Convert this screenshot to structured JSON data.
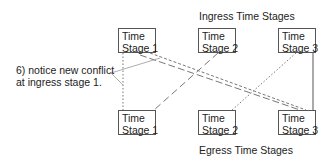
{
  "title_top": "Ingress Time Stages",
  "title_bottom": "Egress Time Stages",
  "annotation": {
    "line1": "6) notice new conflict",
    "line2": "at ingress stage 1."
  },
  "ingress": [
    {
      "line1": "Time",
      "line2": "Stage 1"
    },
    {
      "line1": "Time",
      "line2": "Stage 2"
    },
    {
      "line1": "Time",
      "line2": "Stage 3"
    }
  ],
  "egress": [
    {
      "line1": "Time",
      "line2": "Stage 1"
    },
    {
      "line1": "Time",
      "line2": "Stage 2"
    },
    {
      "line1": "Time",
      "line2": "Stage 3"
    }
  ],
  "connections": [
    {
      "from": "ingress-1",
      "to": "egress-1",
      "style": "dotted"
    },
    {
      "from": "ingress-1",
      "to": "egress-3",
      "style": "short-dash"
    },
    {
      "from": "ingress-1",
      "to": "egress-3",
      "style": "long-dash"
    },
    {
      "from": "ingress-2",
      "to": "egress-1",
      "style": "long-dash"
    },
    {
      "from": "ingress-3",
      "to": "egress-2",
      "style": "dotted"
    },
    {
      "from": "ingress-3",
      "to": "egress-3",
      "style": "solid"
    }
  ]
}
